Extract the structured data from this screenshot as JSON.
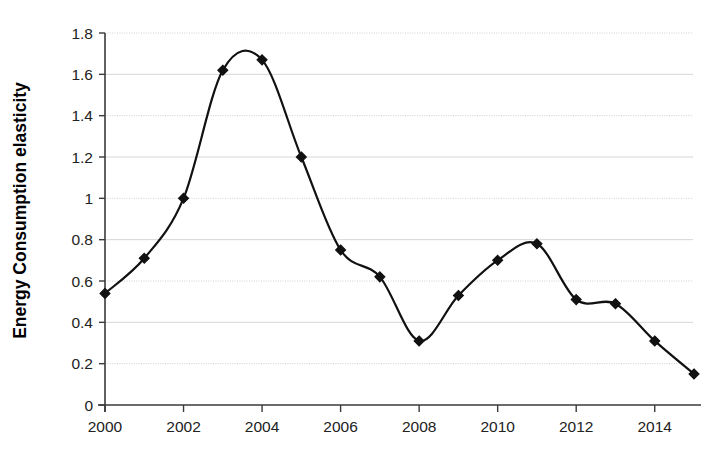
{
  "chart_data": {
    "type": "line",
    "title": "",
    "subtitle": "",
    "xlabel": "",
    "ylabel": "Energy Consumption elasticity",
    "x": [
      2000,
      2001,
      2002,
      2003,
      2004,
      2005,
      2006,
      2007,
      2008,
      2009,
      2010,
      2011,
      2012,
      2013,
      2014,
      2015
    ],
    "values": [
      0.54,
      0.71,
      1.0,
      1.62,
      1.67,
      1.2,
      0.75,
      0.62,
      0.31,
      0.53,
      0.7,
      0.78,
      0.51,
      0.49,
      0.31,
      0.15
    ],
    "series": [
      {
        "name": "Energy Consumption elasticity",
        "values": [
          0.54,
          0.71,
          1.0,
          1.62,
          1.67,
          1.2,
          0.75,
          0.62,
          0.31,
          0.53,
          0.7,
          0.78,
          0.51,
          0.49,
          0.31,
          0.15
        ]
      }
    ],
    "xlim": [
      2000,
      2015
    ],
    "ylim": [
      0,
      1.8
    ],
    "ytick_labels": [
      "0",
      "0.2",
      "0.4",
      "0.6",
      "0.8",
      "1",
      "1.2",
      "1.4",
      "1.6",
      "1.8"
    ],
    "ytick_values": [
      0,
      0.2,
      0.4,
      0.6,
      0.8,
      1.0,
      1.2,
      1.4,
      1.6,
      1.8
    ],
    "xtick_labels": [
      "2000",
      "2002",
      "2004",
      "2006",
      "2008",
      "2010",
      "2012",
      "2014"
    ],
    "xtick_values": [
      2000,
      2002,
      2004,
      2006,
      2008,
      2010,
      2012,
      2014
    ],
    "grid": "horizontal",
    "legend": "none",
    "marker": "diamond",
    "line_color": "#111111",
    "marker_color": "#111111",
    "grid_color": "#d6d6d6",
    "background_color": "#ffffff",
    "smoothing": true,
    "annotations": []
  }
}
